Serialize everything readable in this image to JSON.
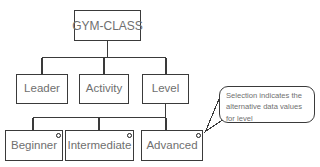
{
  "diagram": {
    "type": "hierarchy-tree",
    "background_color": "#ffffff",
    "line_color": "#3a3a3a",
    "text_color": "#6f6f6f",
    "root": {
      "label": "GYM-CLASS"
    },
    "level2": [
      {
        "label": "Leader"
      },
      {
        "label": "Activity"
      },
      {
        "label": "Level"
      }
    ],
    "level3": [
      {
        "label": "Beginner",
        "selected": true,
        "handle": "selection-handle"
      },
      {
        "label": "Intermediate",
        "selected": true,
        "handle": "selection-handle"
      },
      {
        "label": "Advanced",
        "selected": true,
        "handle": "selection-handle"
      }
    ]
  },
  "callout": {
    "lines": [
      "Selection indicates the",
      "alternative data values",
      "for level"
    ],
    "anchor": "Advanced"
  }
}
